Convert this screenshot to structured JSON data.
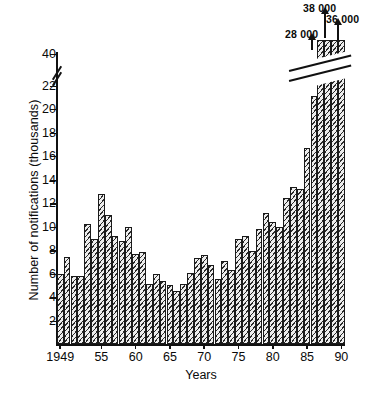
{
  "chart_data": {
    "type": "bar",
    "title": "",
    "xlabel": "Years",
    "ylabel": "Number of notifications (thousands)",
    "ylim": [
      0,
      23
    ],
    "y_break": {
      "below": 22,
      "above": 40,
      "note": "axis broken between 22 and 40"
    },
    "y_ticks": [
      2,
      4,
      6,
      8,
      10,
      12,
      14,
      16,
      18,
      20,
      22,
      40
    ],
    "y_tick_labels": [
      "2",
      "4",
      "6",
      "8",
      "10",
      "12",
      "14",
      "16",
      "18",
      "20",
      "22",
      "40"
    ],
    "x_ticks": [
      1949,
      1955,
      1960,
      1965,
      1970,
      1975,
      1980,
      1985,
      1990
    ],
    "x_tick_labels": [
      "1949",
      "55",
      "60",
      "65",
      "70",
      "75",
      "80",
      "85",
      "90"
    ],
    "grid": false,
    "legend": null,
    "units": "thousands of notifications",
    "categories": [
      1949,
      1950,
      1951,
      1952,
      1953,
      1954,
      1955,
      1956,
      1957,
      1958,
      1959,
      1960,
      1961,
      1962,
      1963,
      1964,
      1965,
      1966,
      1967,
      1968,
      1969,
      1970,
      1971,
      1972,
      1973,
      1974,
      1975,
      1976,
      1977,
      1978,
      1979,
      1980,
      1981,
      1982,
      1983,
      1984,
      1985,
      1986,
      1987,
      1988,
      1989,
      1990
    ],
    "values": [
      6.0,
      7.4,
      5.8,
      5.85,
      10.25,
      8.95,
      12.75,
      11.0,
      9.2,
      8.8,
      9.95,
      7.7,
      7.85,
      5.1,
      5.95,
      5.4,
      5.05,
      4.55,
      5.1,
      6.05,
      7.35,
      7.6,
      6.75,
      5.55,
      7.1,
      6.3,
      8.95,
      9.25,
      7.95,
      9.8,
      11.2,
      10.4,
      10.0,
      12.45,
      13.35,
      13.2,
      16.65,
      21.1,
      28.0,
      38.0,
      36.0,
      36.0
    ],
    "offscale_note": "Bars for 1987-1990 exceed the broken axis; their true values are annotated above.",
    "annotations": [
      {
        "label": "28 000",
        "value": 28000,
        "year": 1987
      },
      {
        "label": "38 000",
        "value": 38000,
        "year": 1988
      },
      {
        "label": "36 000",
        "value": 36000,
        "year": 1989
      }
    ]
  },
  "axis": {
    "ylabel": "Number of notifications (thousands)",
    "xlabel": "Years"
  }
}
